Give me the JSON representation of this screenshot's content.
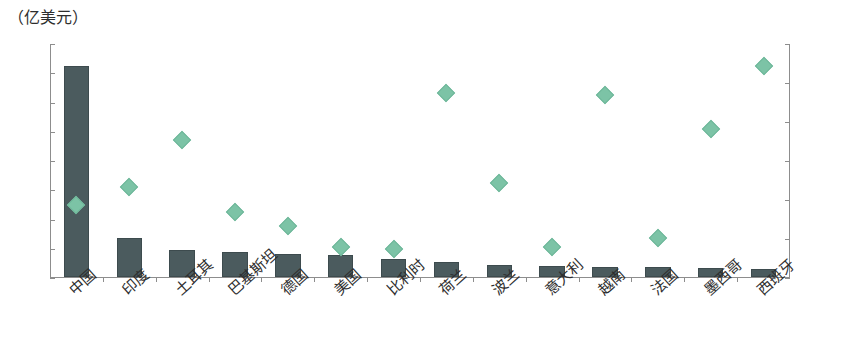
{
  "unit_caption": "（亿美元）",
  "axes": {
    "left_ticks": [
      "400",
      "350",
      "300",
      "250",
      "200",
      "150",
      "100",
      "50",
      "0"
    ],
    "right_ticks": [
      "12%",
      "10%",
      "8%",
      "6%",
      "4%",
      "2%",
      "0"
    ]
  },
  "colors": {
    "bar": "#4b5b5e",
    "marker": "#7cc3a6",
    "axis": "#8d8d8d",
    "text": "#2e2e2e",
    "background": "#ffffff"
  },
  "chart_data": {
    "type": "bar",
    "title": "",
    "subtitle": "",
    "xlabel": "",
    "ylabel": "（亿美元）",
    "y2label": "",
    "grid": false,
    "legend_position": "none",
    "ylim": [
      0,
      400
    ],
    "y2lim": [
      0,
      12
    ],
    "ytick_step": 50,
    "y2tick_step": 2,
    "categories": [
      "中国",
      "印度",
      "土耳其",
      "巴基斯坦",
      "德国",
      "美国",
      "比利时",
      "荷兰",
      "波兰",
      "意大利",
      "越南",
      "法国",
      "墨西哥",
      "西班牙"
    ],
    "series": [
      {
        "name": "金额",
        "type": "bar",
        "axis": "left",
        "unit": "亿美元",
        "values": [
          360,
          67,
          46,
          43,
          40,
          37,
          30,
          26,
          21,
          19,
          17,
          17,
          16,
          13
        ]
      },
      {
        "name": "占比",
        "type": "scatter",
        "axis": "right",
        "unit": "%",
        "marker": "diamond",
        "values": [
          4.1,
          5.0,
          7.4,
          3.7,
          3.0,
          1.9,
          1.8,
          9.8,
          5.2,
          1.9,
          9.7,
          2.4,
          8.0,
          11.2
        ]
      }
    ]
  }
}
